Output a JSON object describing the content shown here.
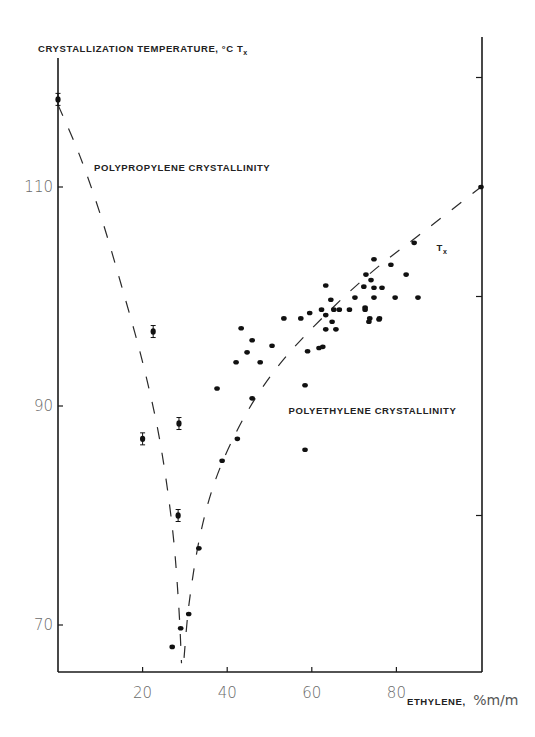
{
  "chart_data": {
    "type": "scatter",
    "title": "",
    "ylabel": "CRYSTALLIZATION TEMPERATURE, °C T",
    "ylabel_subscript": "x",
    "xlabel": "ETHYLENE,",
    "xlabel_unit": "%m/m",
    "xlim": [
      0,
      100
    ],
    "ylim": [
      65.7,
      121
    ],
    "xticks": [
      20,
      40,
      60,
      80
    ],
    "xtick_labels": [
      "20",
      "40",
      "60",
      "80"
    ],
    "yticks": [
      70,
      90,
      110
    ],
    "ytick_labels": [
      "70",
      "90",
      "110"
    ],
    "right_axis_ticks": [
      80,
      100,
      120
    ],
    "grid": false,
    "annotations": [
      {
        "text": "POLYPROPYLENE CRYSTALLINITY",
        "x": 8.5,
        "y": 111.5
      },
      {
        "text": "POLYETHYLENE CRYSTALLINITY",
        "x": 54.5,
        "y": 89.3
      },
      {
        "text": "T",
        "subscript": "x",
        "x": 89.5,
        "y": 104.2
      }
    ],
    "series": [
      {
        "name": "polypropylene crystallinity (with error bars)",
        "marker": "point-errorbar",
        "points": [
          {
            "x": 0,
            "y": 118
          },
          {
            "x": 22.5,
            "y": 96.8
          },
          {
            "x": 20,
            "y": 87
          },
          {
            "x": 28.6,
            "y": 88.4
          },
          {
            "x": 28.4,
            "y": 80
          }
        ]
      },
      {
        "name": "polyethylene crystallinity",
        "marker": "point",
        "points": [
          {
            "x": 27,
            "y": 68
          },
          {
            "x": 29,
            "y": 69.7
          },
          {
            "x": 30.9,
            "y": 71
          },
          {
            "x": 33.3,
            "y": 77
          },
          {
            "x": 38.8,
            "y": 85
          },
          {
            "x": 42.4,
            "y": 87
          },
          {
            "x": 37.6,
            "y": 91.6
          },
          {
            "x": 45.9,
            "y": 90.7
          },
          {
            "x": 43.3,
            "y": 97.1
          },
          {
            "x": 45.9,
            "y": 96
          },
          {
            "x": 44.7,
            "y": 94.9
          },
          {
            "x": 42.1,
            "y": 94
          },
          {
            "x": 47.8,
            "y": 94
          },
          {
            "x": 50.6,
            "y": 95.5
          },
          {
            "x": 53.4,
            "y": 98
          },
          {
            "x": 57.4,
            "y": 98
          },
          {
            "x": 59.5,
            "y": 98.5
          },
          {
            "x": 62.3,
            "y": 98.8
          },
          {
            "x": 63.3,
            "y": 98.3
          },
          {
            "x": 63.3,
            "y": 97
          },
          {
            "x": 65.7,
            "y": 97
          },
          {
            "x": 64.8,
            "y": 97.7
          },
          {
            "x": 61.7,
            "y": 95.3
          },
          {
            "x": 62.6,
            "y": 95.4
          },
          {
            "x": 59,
            "y": 95
          },
          {
            "x": 58.4,
            "y": 91.9
          },
          {
            "x": 58.4,
            "y": 86
          },
          {
            "x": 63.3,
            "y": 101
          },
          {
            "x": 64.5,
            "y": 99.7
          },
          {
            "x": 65.2,
            "y": 98.8
          },
          {
            "x": 66.5,
            "y": 98.8
          },
          {
            "x": 68.9,
            "y": 98.8
          },
          {
            "x": 70.2,
            "y": 99.9
          },
          {
            "x": 72.6,
            "y": 98.8
          },
          {
            "x": 72.6,
            "y": 99
          },
          {
            "x": 73.5,
            "y": 97.7
          },
          {
            "x": 75.9,
            "y": 97.9
          },
          {
            "x": 73.7,
            "y": 98
          },
          {
            "x": 76,
            "y": 98
          },
          {
            "x": 72.3,
            "y": 100.9
          },
          {
            "x": 74.7,
            "y": 100.8
          },
          {
            "x": 76.6,
            "y": 100.8
          },
          {
            "x": 74.7,
            "y": 99.9
          },
          {
            "x": 79.7,
            "y": 99.9
          },
          {
            "x": 85.1,
            "y": 99.9
          },
          {
            "x": 72.8,
            "y": 102
          },
          {
            "x": 74,
            "y": 101.5
          },
          {
            "x": 82.3,
            "y": 102
          },
          {
            "x": 78.7,
            "y": 102.9
          },
          {
            "x": 74.7,
            "y": 103.4
          },
          {
            "x": 84.2,
            "y": 104.9
          },
          {
            "x": 100,
            "y": 110
          }
        ]
      }
    ],
    "curves": [
      {
        "name": "polypropylene crystallinity trend",
        "style": "dashed",
        "points": [
          {
            "x": 0,
            "y": 117.5
          },
          {
            "x": 5,
            "y": 113
          },
          {
            "x": 10,
            "y": 107.5
          },
          {
            "x": 15,
            "y": 101
          },
          {
            "x": 20,
            "y": 94
          },
          {
            "x": 24,
            "y": 87
          },
          {
            "x": 27,
            "y": 79
          },
          {
            "x": 28.5,
            "y": 72
          },
          {
            "x": 29.2,
            "y": 66.5
          }
        ]
      },
      {
        "name": "polyethylene crystallinity trend (Tx)",
        "style": "dashed",
        "points": [
          {
            "x": 29.8,
            "y": 67
          },
          {
            "x": 31,
            "y": 72
          },
          {
            "x": 33.5,
            "y": 78
          },
          {
            "x": 37,
            "y": 83
          },
          {
            "x": 42,
            "y": 87.5
          },
          {
            "x": 48,
            "y": 91.5
          },
          {
            "x": 55,
            "y": 95
          },
          {
            "x": 65,
            "y": 99
          },
          {
            "x": 75,
            "y": 102.5
          },
          {
            "x": 85,
            "y": 105.5
          },
          {
            "x": 100,
            "y": 110
          }
        ]
      }
    ]
  }
}
